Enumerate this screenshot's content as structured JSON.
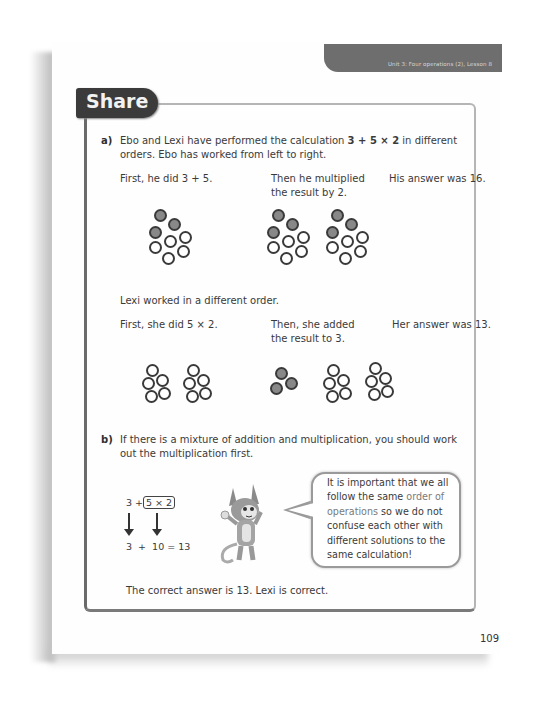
{
  "header": {
    "unit_label": "Unit 3: Four operations (2), Lesson 8"
  },
  "section": {
    "title": "Share"
  },
  "part_a": {
    "label": "a)",
    "intro_line1_pre": "Ebo and Lexi have performed the calculation ",
    "intro_expression": "3 + 5 × 2",
    "intro_line1_post": " in different",
    "intro_line2": "orders. Ebo has worked from left to right.",
    "ebo": {
      "step1": "First, he did 3 + 5.",
      "step2_line1": "Then he multiplied",
      "step2_line2": "the result by 2.",
      "answer": "His answer was 16."
    },
    "lexi_intro": "Lexi worked in a different order.",
    "lexi": {
      "step1": "First, she did 5 × 2.",
      "step2_line1": "Then, she added",
      "step2_line2": "the result to 3.",
      "answer": "Her answer was 13."
    }
  },
  "part_b": {
    "label": "b)",
    "line1": "If there is a mixture of addition and multiplication, you should work",
    "line2": "out the multiplication first.",
    "calc_top_left": "3 +",
    "calc_boxed": "5 × 2",
    "calc_bottom": "3  +  10 = 13",
    "speech": {
      "before": "It is important that we all\nfollow the same ",
      "highlight1": "order of",
      "newline": "\n",
      "highlight2": "operations",
      "after": " so we do not\nconfuse each other with\ndifferent solutions to the\nsame calculation!"
    },
    "conclusion": "The correct answer is 13. Lexi is correct."
  },
  "footer": {
    "page_number": "109"
  },
  "colors": {
    "tab_dark": "#3b3b3b",
    "unit_tab": "#6e6e6e",
    "counter_filled": "#888888",
    "counter_outline": "#3a3a3a"
  }
}
